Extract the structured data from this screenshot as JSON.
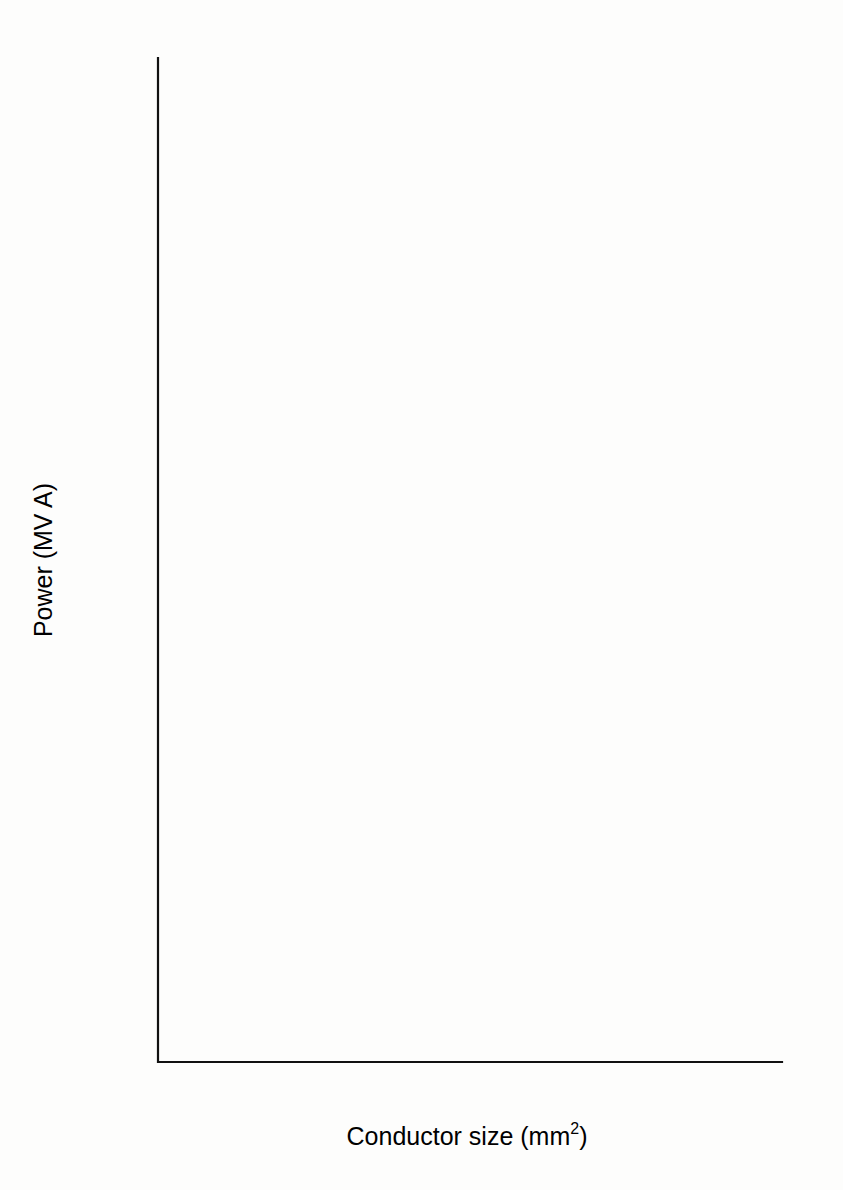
{
  "chart_data": {
    "type": "line",
    "title": "",
    "xlabel": "Conductor size (mm2)",
    "xlabel_base": "Conductor size (mm",
    "xlabel_sup": "2",
    "xlabel_tail": ")",
    "ylabel": "Power (MV A)",
    "xlim": [
      500,
      3500
    ],
    "ylim": [
      400,
      2200
    ],
    "xticks": [
      500,
      1000,
      1500,
      2000,
      2500,
      3000,
      3500
    ],
    "xtick_labels": [
      "500",
      "1000",
      "1500",
      "2000",
      "2500",
      "3000",
      "3500"
    ],
    "yticks": [
      400,
      600,
      800,
      1000,
      1200,
      1400,
      1600,
      1800,
      2000,
      2200
    ],
    "ytick_labels": [
      "400",
      "600",
      "800",
      "1000",
      "1200",
      "1400",
      "1600",
      "1800",
      "2000",
      "2200"
    ],
    "x_minor_step": 100,
    "y_minor_step": 100,
    "grid": false,
    "legend_position": "inline-right",
    "line_color": "#1b1b1b",
    "series": [
      {
        "name": "400 kV copper",
        "label_line1": "400 kV",
        "label_line2": "copper",
        "x": [
          1000,
          1200,
          1400,
          1600,
          1800,
          2000,
          2200,
          2400,
          2600,
          2800,
          3000
        ],
        "values": [
          1060,
          1200,
          1330,
          1465,
          1585,
          1690,
          1775,
          1840,
          1900,
          1955,
          2005
        ]
      },
      {
        "name": "400 kV aluminium",
        "label_line1": "400 kV",
        "label_line2": "aluminium",
        "x": [
          1000,
          1200,
          1400,
          1600,
          1800,
          2000,
          2200,
          2400,
          2600,
          2800,
          3000
        ],
        "values": [
          845,
          960,
          1075,
          1185,
          1286,
          1370,
          1440,
          1495,
          1545,
          1590,
          1630
        ]
      },
      {
        "name": "275 kV copper",
        "label_line1": "275 kV",
        "label_line2": "copper",
        "x": [
          1000,
          1200,
          1400,
          1600,
          1800,
          2000,
          2200,
          2400,
          2600,
          2800,
          3000
        ],
        "values": [
          811,
          905,
          1000,
          1098,
          1189,
          1265,
          1335,
          1395,
          1440,
          1478,
          1510
        ]
      },
      {
        "name": "275 kV aluminium",
        "label_line1": "275 kV",
        "label_line2": "aluminium",
        "x": [
          1000,
          1200,
          1400,
          1600,
          1800,
          2000,
          2200,
          2400,
          2600,
          2800,
          3000
        ],
        "values": [
          625,
          705,
          790,
          880,
          990,
          1065,
          1115,
          1150,
          1185,
          1212,
          1235
        ]
      }
    ],
    "annotations": [
      {
        "text": "400 kV copper",
        "x_px": 690,
        "y_px": 160
      },
      {
        "text": "400 kV aluminium",
        "x_px": 690,
        "y_px": 365
      },
      {
        "text": "275 kV copper",
        "x_px": 690,
        "y_px": 432
      },
      {
        "text": "275 kV aluminium",
        "x_px": 690,
        "y_px": 575
      }
    ]
  }
}
